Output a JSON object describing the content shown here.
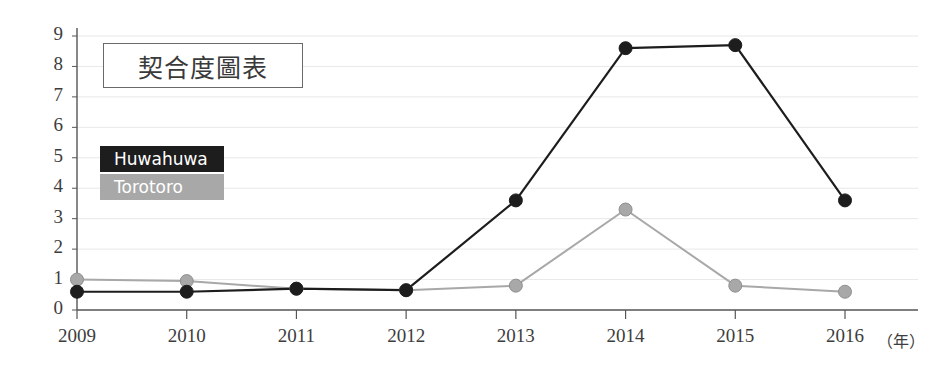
{
  "chart_data": {
    "type": "line",
    "title": "契合度圖表",
    "xlabel": "（年）",
    "ylabel": "",
    "categories": [
      "2009",
      "2010",
      "2011",
      "2012",
      "2013",
      "2014",
      "2015",
      "2016"
    ],
    "x_unit_suffix": "（年）",
    "ylim": [
      0,
      9
    ],
    "xlim": [
      "2009",
      "2016"
    ],
    "y_ticks": [
      "0",
      "1",
      "2",
      "3",
      "4",
      "5",
      "6",
      "7",
      "8",
      "9"
    ],
    "grid": true,
    "grid_orientation": "horizontal",
    "legend_position": "upper-left-inside",
    "series": [
      {
        "name": "Huwahuwa",
        "color": "#1d1d1d",
        "marker": "circle",
        "values": [
          0.6,
          0.6,
          0.7,
          0.65,
          3.6,
          8.6,
          8.7,
          3.6
        ]
      },
      {
        "name": "Torotoro",
        "color": "#a8a8a8",
        "marker": "circle",
        "values": [
          1.0,
          0.95,
          0.7,
          0.65,
          0.8,
          3.3,
          0.8,
          0.6
        ]
      }
    ]
  },
  "colors": {
    "series_huwahuwa": "#1d1d1d",
    "series_torotoro": "#a8a8a8",
    "axis": "#555555",
    "grid": "#e8e8ea",
    "text": "#3d3d3d",
    "legend_text": "#ffffff",
    "background": "#ffffff"
  }
}
